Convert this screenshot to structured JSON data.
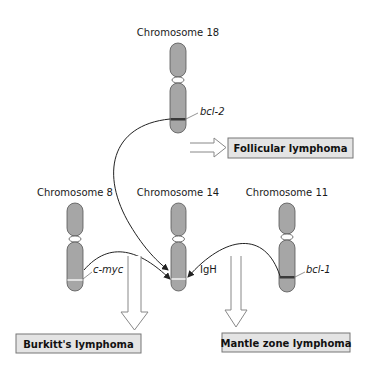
{
  "chromosomes": {
    "chr18": {
      "title": "Chromosome 18",
      "gene": "bcl-2",
      "band": "dark"
    },
    "chr8": {
      "title": "Chromosome 8",
      "gene": "c-myc",
      "band": "light"
    },
    "chr14": {
      "title": "Chromosome 14",
      "gene": "IgH",
      "band": "light"
    },
    "chr11": {
      "title": "Chromosome 11",
      "gene": "bcl-1",
      "band": "dark"
    }
  },
  "outcomes": {
    "follicular": "Follicular lymphoma",
    "burkitt": "Burkitt's lymphoma",
    "mantle": "Mantle zone lymphoma"
  },
  "colors": {
    "chromosome_fill": "#a6a6a6",
    "dark_band": "#3a3a3a",
    "light_band": "#e0e0e0",
    "box_fill": "#e4e4e4"
  }
}
